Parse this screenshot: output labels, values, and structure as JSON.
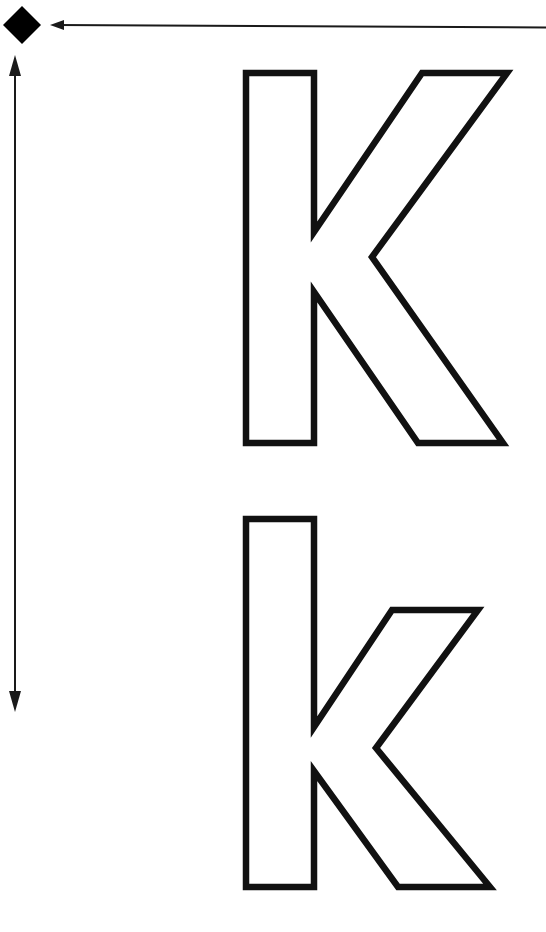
{
  "page": {
    "title": "Letter K tracing sheet",
    "width": 546,
    "height": 932,
    "background_color": "#ffffff",
    "ink_color": "#111111"
  },
  "letters": {
    "uppercase": {
      "character": "K",
      "label": "uppercase-letter-k",
      "style": "hollow-outline",
      "bounds": {
        "x": 246,
        "y": 70,
        "width": 261,
        "height": 376
      }
    },
    "lowercase": {
      "character": "k",
      "label": "lowercase-letter-k",
      "style": "hollow-outline",
      "bounds": {
        "x": 246,
        "y": 516,
        "width": 245,
        "height": 374
      }
    }
  },
  "annotations": {
    "diamond_marker": {
      "name": "start-point-diamond",
      "color": "#000000",
      "center_x": 22,
      "center_y": 25,
      "radius": 19
    },
    "horizontal_arrow": {
      "name": "horizontal-guide-arrow",
      "direction": "left",
      "from_x": 546,
      "to_x": 52,
      "y": 25,
      "color": "#1a1a1a"
    },
    "vertical_arrow": {
      "name": "vertical-guide-arrow",
      "direction": "both",
      "x": 15,
      "from_y": 57,
      "to_y": 710,
      "color": "#1a1a1a"
    }
  },
  "geometry": {
    "uppercase_path": "M 246,73 L 314,73 L 314,232 L 422,73 L 507,73 L 372,257 L 503,443 L 418,443 L 314,292 L 314,443 L 246,443 Z",
    "lowercase_path": "M 246,519 L 314,519 L 314,727 L 392,610 L 478,610 L 376,748 L 490,887 L 398,887 L 314,771 L 314,887 L 246,887 Z"
  }
}
